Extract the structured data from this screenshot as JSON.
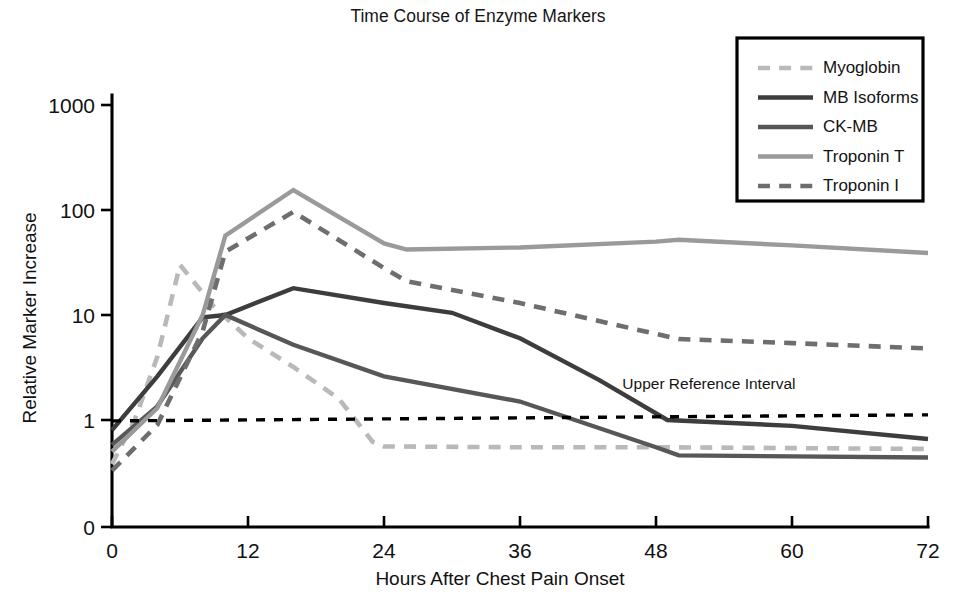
{
  "chart_data": {
    "type": "line",
    "title": "Time Course of Enzyme Markers",
    "xlabel": "Hours After Chest Pain Onset",
    "ylabel": "Relative Marker Increase",
    "xlim": [
      0,
      72
    ],
    "ylim": [
      0.3,
      1000
    ],
    "yscale": "log",
    "grid": false,
    "legend_position": "top-right",
    "xticks": [
      "0",
      "12",
      "24",
      "36",
      "48",
      "60",
      "72"
    ],
    "xtick_values": [
      0,
      12,
      24,
      36,
      48,
      60,
      72
    ],
    "yticks": [
      "1000",
      "100",
      "10",
      "1",
      "0"
    ],
    "ytick_values": [
      1000,
      100,
      10,
      1,
      0
    ],
    "annotations": [
      {
        "text": "Upper Reference Interval",
        "x": 49,
        "y": 1.9
      }
    ],
    "reference_line": {
      "label": "Upper Reference Interval",
      "value": 1.05,
      "style": "dotted",
      "color": "#000000",
      "x": [
        0,
        72
      ],
      "y": [
        0.98,
        1.12
      ]
    },
    "series": [
      {
        "name": "Myoglobin",
        "color": "#b9b9b9",
        "style": "dashed",
        "width": 4.6,
        "x": [
          0,
          2,
          4,
          6,
          9,
          12,
          16,
          20,
          23,
          24,
          36,
          48,
          60,
          72
        ],
        "y": [
          0.38,
          1.0,
          4.0,
          30.0,
          12.0,
          6.0,
          3.2,
          1.6,
          0.62,
          0.56,
          0.55,
          0.55,
          0.54,
          0.53
        ]
      },
      {
        "name": "MB Isoforms",
        "color": "#3d3d3d",
        "style": "solid",
        "width": 4.4,
        "x": [
          0,
          4,
          8,
          10,
          16,
          24,
          30,
          36,
          43,
          49,
          60,
          72
        ],
        "y": [
          0.8,
          2.6,
          9.5,
          10.0,
          18.0,
          13.0,
          10.5,
          6.0,
          2.4,
          1.0,
          0.88,
          0.66
        ]
      },
      {
        "name": "CK-MB",
        "color": "#575757",
        "style": "solid",
        "width": 4.4,
        "x": [
          0,
          4,
          8,
          10,
          16,
          24,
          36,
          48,
          50,
          60,
          72
        ],
        "y": [
          0.58,
          1.35,
          6.0,
          10.0,
          5.2,
          2.6,
          1.5,
          0.55,
          0.46,
          0.45,
          0.44
        ]
      },
      {
        "name": "Troponin T",
        "color": "#9a9a9a",
        "style": "solid",
        "width": 4.4,
        "x": [
          0,
          4,
          8,
          10,
          16,
          24,
          26,
          36,
          48,
          50,
          60,
          72
        ],
        "y": [
          0.5,
          1.3,
          10.0,
          57.0,
          155.0,
          48.0,
          42.0,
          44.0,
          50.0,
          52.0,
          46.0,
          39.0
        ]
      },
      {
        "name": "Troponin I",
        "color": "#6e6e6e",
        "style": "dashed",
        "width": 4.6,
        "x": [
          0,
          4,
          8,
          10,
          16,
          24,
          26,
          36,
          48,
          50,
          60,
          72
        ],
        "y": [
          0.33,
          0.9,
          7.0,
          40.0,
          96.0,
          28.0,
          21.0,
          13.0,
          6.6,
          5.9,
          5.4,
          4.8
        ]
      }
    ]
  },
  "legend": {
    "items": [
      {
        "label": "Myoglobin"
      },
      {
        "label": "MB Isoforms"
      },
      {
        "label": "CK-MB"
      },
      {
        "label": "Troponin T"
      },
      {
        "label": "Troponin I"
      }
    ]
  }
}
